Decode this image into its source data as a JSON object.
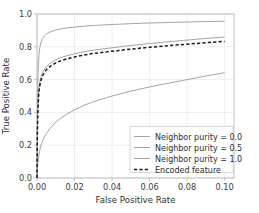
{
  "chart_data": {
    "type": "line",
    "title": "",
    "xlabel": "False Positive Rate",
    "ylabel": "True Positive Rate",
    "xlim": [
      0.0,
      0.105
    ],
    "ylim": [
      0.0,
      1.0
    ],
    "grid": true,
    "legend_position": "lower right",
    "xticks": [
      "0.00",
      "0.02",
      "0.04",
      "0.06",
      "0.08",
      "0.10"
    ],
    "xtick_values": [
      0.0,
      0.02,
      0.04,
      0.06,
      0.08,
      0.1
    ],
    "yticks": [
      "0.0",
      "0.2",
      "0.4",
      "0.6",
      "0.8",
      "1.0"
    ],
    "ytick_values": [
      0.0,
      0.2,
      0.4,
      0.6,
      0.8,
      1.0
    ],
    "series": [
      {
        "name": "Neighbor purity = 0.0",
        "color": "#9a9a9a",
        "style": "solid",
        "x": [
          0.0,
          0.0002,
          0.0005,
          0.001,
          0.0015,
          0.002,
          0.003,
          0.004,
          0.005,
          0.006,
          0.008,
          0.01,
          0.013,
          0.016,
          0.02,
          0.025,
          0.03,
          0.04,
          0.05,
          0.06,
          0.07,
          0.08,
          0.09,
          0.1
        ],
        "y": [
          0.0,
          0.4,
          0.62,
          0.745,
          0.795,
          0.822,
          0.852,
          0.868,
          0.878,
          0.885,
          0.895,
          0.902,
          0.91,
          0.915,
          0.92,
          0.926,
          0.93,
          0.936,
          0.941,
          0.945,
          0.948,
          0.951,
          0.954,
          0.956
        ]
      },
      {
        "name": "Neighbor purity = 0.5",
        "color": "#9a9a9a",
        "style": "solid",
        "x": [
          0.0,
          0.0002,
          0.0005,
          0.001,
          0.0015,
          0.002,
          0.003,
          0.004,
          0.005,
          0.007,
          0.01,
          0.013,
          0.016,
          0.02,
          0.025,
          0.03,
          0.04,
          0.05,
          0.06,
          0.07,
          0.08,
          0.09,
          0.1
        ],
        "y": [
          0.0,
          0.3,
          0.44,
          0.545,
          0.585,
          0.612,
          0.645,
          0.665,
          0.68,
          0.7,
          0.72,
          0.735,
          0.746,
          0.757,
          0.77,
          0.779,
          0.794,
          0.808,
          0.82,
          0.831,
          0.841,
          0.851,
          0.86
        ]
      },
      {
        "name": "Neighbor purity = 1.0",
        "color": "#9a9a9a",
        "style": "solid",
        "x": [
          0.0,
          0.0002,
          0.0005,
          0.001,
          0.0015,
          0.002,
          0.003,
          0.004,
          0.005,
          0.007,
          0.01,
          0.013,
          0.016,
          0.02,
          0.025,
          0.03,
          0.04,
          0.05,
          0.06,
          0.07,
          0.08,
          0.09,
          0.1
        ],
        "y": [
          0.0,
          0.055,
          0.095,
          0.14,
          0.17,
          0.195,
          0.228,
          0.252,
          0.272,
          0.303,
          0.34,
          0.368,
          0.39,
          0.415,
          0.443,
          0.465,
          0.5,
          0.53,
          0.555,
          0.578,
          0.6,
          0.622,
          0.642
        ]
      },
      {
        "name": "Encoded feature",
        "color": "#1a1a1a",
        "style": "dashed",
        "x": [
          0.0,
          0.0002,
          0.0005,
          0.001,
          0.0015,
          0.002,
          0.003,
          0.004,
          0.005,
          0.007,
          0.01,
          0.013,
          0.016,
          0.02,
          0.025,
          0.03,
          0.04,
          0.05,
          0.06,
          0.07,
          0.08,
          0.09,
          0.1
        ],
        "y": [
          0.0,
          0.28,
          0.42,
          0.525,
          0.565,
          0.592,
          0.625,
          0.645,
          0.66,
          0.681,
          0.702,
          0.716,
          0.727,
          0.738,
          0.75,
          0.759,
          0.773,
          0.786,
          0.797,
          0.807,
          0.816,
          0.825,
          0.833
        ]
      }
    ]
  },
  "axes": {
    "xlabel": "False Positive Rate",
    "ylabel": "True Positive Rate"
  },
  "legend": {
    "entries": [
      {
        "label": "Neighbor purity = 0.0",
        "color": "#9a9a9a",
        "style": "solid"
      },
      {
        "label": "Neighbor purity = 0.5",
        "color": "#9a9a9a",
        "style": "solid"
      },
      {
        "label": "Neighbor purity = 1.0",
        "color": "#9a9a9a",
        "style": "solid"
      },
      {
        "label": "Encoded feature",
        "color": "#1a1a1a",
        "style": "dashed"
      }
    ]
  },
  "style": {
    "background": "#ffffff",
    "grid_color": "#e6e6e6",
    "spine_color": "#b8b8b8",
    "tick_text_color": "#3b3b3b"
  }
}
